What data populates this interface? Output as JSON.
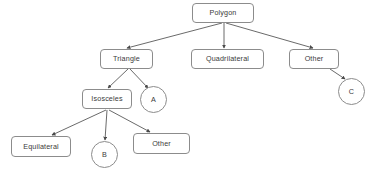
{
  "diagram": {
    "background_color": "#ffffff",
    "node_border_color": "#8c8c8c",
    "node_fill_color": "#ffffff",
    "edge_color": "#595959",
    "text_color": "#3a3a3a",
    "nodes": [
      {
        "id": "polygon",
        "label": "Polygon",
        "shape": "box",
        "x": 192,
        "y": 3,
        "w": 62,
        "h": 20
      },
      {
        "id": "triangle",
        "label": "Triangle",
        "shape": "box",
        "x": 100,
        "y": 49,
        "w": 53,
        "h": 20
      },
      {
        "id": "quadrilateral",
        "label": "Quadrilateral",
        "shape": "box",
        "x": 191,
        "y": 49,
        "w": 73,
        "h": 20
      },
      {
        "id": "other_top",
        "label": "Other",
        "shape": "box",
        "x": 289,
        "y": 49,
        "w": 50,
        "h": 20
      },
      {
        "id": "c_circle",
        "label": "C",
        "shape": "circle",
        "x": 338,
        "y": 78,
        "w": 27,
        "h": 27
      },
      {
        "id": "isosceles",
        "label": "Isosceles",
        "shape": "box",
        "x": 82,
        "y": 89,
        "w": 50,
        "h": 20
      },
      {
        "id": "a_circle",
        "label": "A",
        "shape": "circle",
        "x": 140,
        "y": 86,
        "w": 27,
        "h": 27
      },
      {
        "id": "equilateral",
        "label": "Equilateral",
        "shape": "box",
        "x": 11,
        "y": 136,
        "w": 60,
        "h": 21
      },
      {
        "id": "b_circle",
        "label": "B",
        "shape": "circle",
        "x": 91,
        "y": 141,
        "w": 27,
        "h": 27
      },
      {
        "id": "other_bottom",
        "label": "Other",
        "shape": "box",
        "x": 133,
        "y": 133,
        "w": 57,
        "h": 21
      }
    ],
    "edges": [
      {
        "from": "polygon",
        "to": "triangle",
        "x1": 222,
        "y1": 23,
        "x2": 127,
        "y2": 48
      },
      {
        "from": "polygon",
        "to": "quadrilateral",
        "x1": 224,
        "y1": 23,
        "x2": 224,
        "y2": 48
      },
      {
        "from": "polygon",
        "to": "other_top",
        "x1": 226,
        "y1": 23,
        "x2": 313,
        "y2": 48
      },
      {
        "from": "other_top",
        "to": "c_circle",
        "x1": 330,
        "y1": 69,
        "x2": 345,
        "y2": 79
      },
      {
        "from": "triangle",
        "to": "isosceles",
        "x1": 128,
        "y1": 69,
        "x2": 108,
        "y2": 88
      },
      {
        "from": "triangle",
        "to": "a_circle",
        "x1": 130,
        "y1": 69,
        "x2": 148,
        "y2": 88
      },
      {
        "from": "isosceles",
        "to": "equilateral",
        "x1": 106,
        "y1": 110,
        "x2": 52,
        "y2": 135
      },
      {
        "from": "isosceles",
        "to": "b_circle",
        "x1": 107,
        "y1": 110,
        "x2": 105,
        "y2": 140
      },
      {
        "from": "isosceles",
        "to": "other_bottom",
        "x1": 109,
        "y1": 110,
        "x2": 150,
        "y2": 132
      }
    ]
  }
}
